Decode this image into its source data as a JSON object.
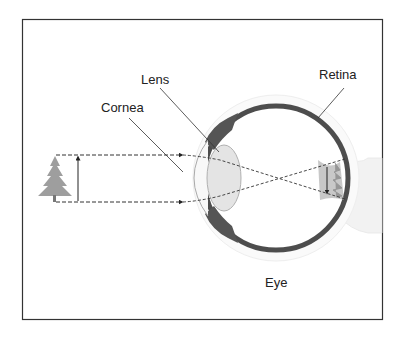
{
  "diagram": {
    "title": "Eye",
    "labels": {
      "lens": "Lens",
      "cornea": "Cornea",
      "retina": "Retina",
      "eye": "Eye"
    },
    "object": "tree",
    "image": "inverted tree on retina",
    "colors": {
      "frame": "#333333",
      "sclera": "#4a4a4a",
      "lens_fill": "#e6e6e6",
      "tree": "#9a9a9a",
      "rays": "#333333",
      "outer_glow": "#f0f0f0"
    }
  }
}
